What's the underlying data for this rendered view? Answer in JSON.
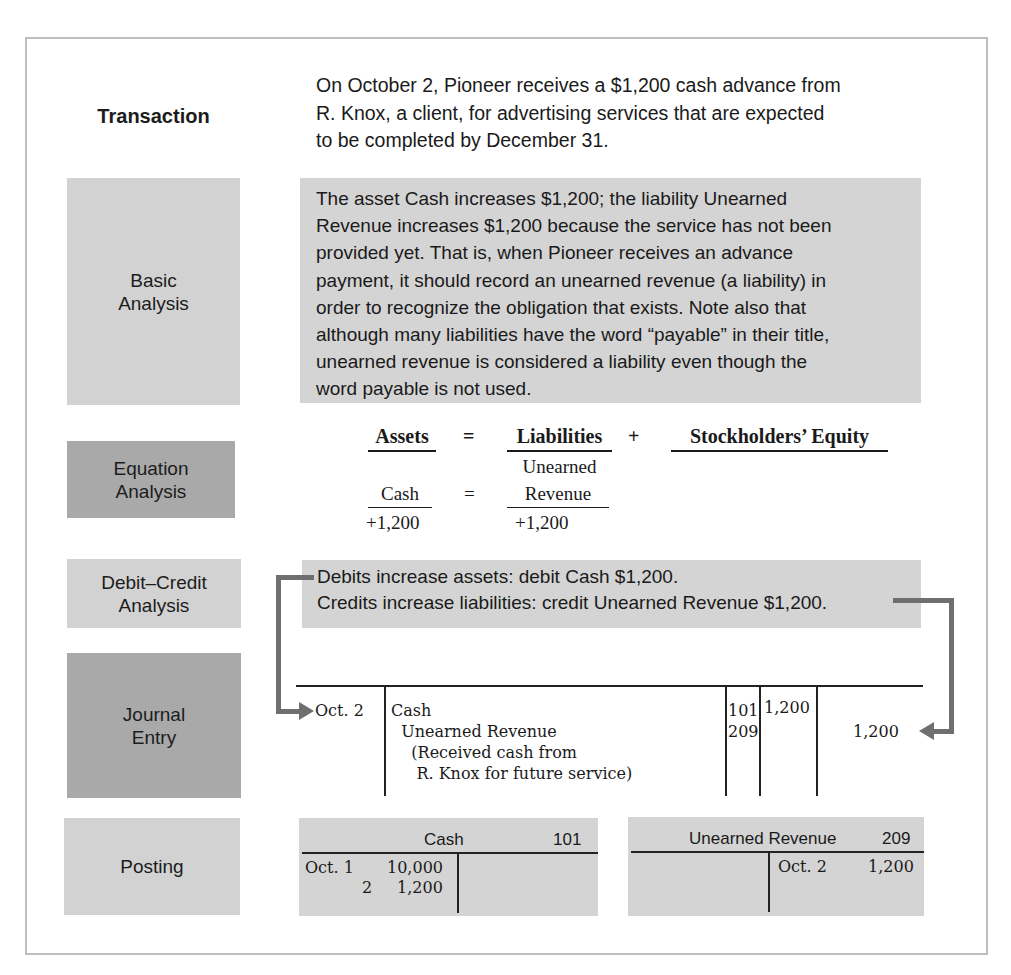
{
  "labels": {
    "transaction": "Transaction",
    "basic_analysis": "Basic\nAnalysis",
    "equation_analysis": "Equation\nAnalysis",
    "debit_credit_analysis": "Debit–Credit\nAnalysis",
    "journal_entry": "Journal\nEntry",
    "posting": "Posting"
  },
  "transaction": {
    "lines": [
      "On October 2, Pioneer receives a $1,200 cash advance from",
      "R. Knox, a client, for advertising services that are expected",
      "to be completed by December 31."
    ]
  },
  "basic_analysis": {
    "lines": [
      "The asset Cash increases $1,200; the liability Unearned",
      "Revenue increases $1,200 because the service has not been",
      "provided yet. That is, when Pioneer receives an advance",
      "payment, it should record an unearned revenue (a liability) in",
      "order to recognize the obligation that exists. Note also that",
      "although many liabilities have the word “payable” in their title,",
      "unearned revenue is considered a liability even though the",
      "word payable is not used."
    ]
  },
  "equation_analysis": {
    "header": {
      "assets": "Assets",
      "equals": "=",
      "liabilities": "Liabilities",
      "plus": "+",
      "equity": "Stockholders’ Equity"
    },
    "row": {
      "asset_account": "Cash",
      "equals": "=",
      "liability_account_line1": "Unearned",
      "liability_account_line2": "Revenue",
      "asset_change": "+1,200",
      "liability_change": "+1,200"
    }
  },
  "debit_credit_analysis": {
    "lines": [
      "Debits increase assets: debit Cash $1,200.",
      "Credits increase liabilities: credit Unearned Revenue $1,200."
    ]
  },
  "journal_entry": {
    "date": "Oct. 2",
    "rows": [
      {
        "account": "Cash",
        "ref": "101",
        "debit": "1,200",
        "credit": ""
      },
      {
        "account": "  Unearned Revenue",
        "ref": "209",
        "debit": "",
        "credit": "1,200"
      }
    ],
    "explanation_lines": [
      "    (Received cash from",
      "     R. Knox for future service)"
    ]
  },
  "posting": {
    "cash_account": {
      "title": "Cash",
      "number": "101",
      "debit_entries": [
        {
          "date": "Oct. 1",
          "amount": "10,000"
        },
        {
          "date": "2",
          "amount": "1,200"
        }
      ],
      "credit_entries": []
    },
    "unearned_revenue_account": {
      "title": "Unearned Revenue",
      "number": "209",
      "debit_entries": [],
      "credit_entries": [
        {
          "date": "Oct. 2",
          "amount": "1,200"
        }
      ]
    }
  },
  "colors": {
    "light_box": "#d2d2d2",
    "dark_box": "#a9a9a9",
    "arrow": "#6f6f6f",
    "frame_border": "#bdbdbd"
  }
}
